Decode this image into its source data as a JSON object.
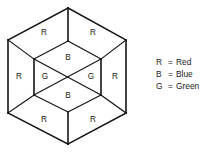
{
  "figure": {
    "shape_name": "hexagon-cube-diagram",
    "outer_vertices": [
      {
        "name": "top",
        "x": 68,
        "y": 8
      },
      {
        "name": "upper-right",
        "x": 126,
        "y": 40
      },
      {
        "name": "lower-right",
        "x": 126,
        "y": 113
      },
      {
        "name": "bottom",
        "x": 68,
        "y": 144
      },
      {
        "name": "lower-left",
        "x": 8,
        "y": 113
      },
      {
        "name": "upper-left",
        "x": 8,
        "y": 40
      }
    ],
    "inner_vertices": [
      {
        "name": "inner-top",
        "x": 68,
        "y": 41
      },
      {
        "name": "inner-upper-right",
        "x": 101,
        "y": 59
      },
      {
        "name": "inner-lower-right",
        "x": 101,
        "y": 95
      },
      {
        "name": "inner-bottom",
        "x": 68,
        "y": 112
      },
      {
        "name": "inner-lower-left",
        "x": 34,
        "y": 95
      },
      {
        "name": "inner-upper-left",
        "x": 34,
        "y": 59
      }
    ],
    "center": {
      "x": 68,
      "y": 77
    },
    "region_labels": [
      {
        "id": "top-left-region",
        "text": "R",
        "x": 44,
        "y": 33
      },
      {
        "id": "top-right-region",
        "text": "R",
        "x": 93,
        "y": 33
      },
      {
        "id": "upper-inner-region",
        "text": "B",
        "x": 68,
        "y": 58
      },
      {
        "id": "left-outer-region",
        "text": "R",
        "x": 19,
        "y": 77
      },
      {
        "id": "left-inner-region",
        "text": "G",
        "x": 45,
        "y": 77
      },
      {
        "id": "right-inner-region",
        "text": "G",
        "x": 91,
        "y": 77
      },
      {
        "id": "right-outer-region",
        "text": "R",
        "x": 115,
        "y": 77
      },
      {
        "id": "lower-inner-region",
        "text": "B",
        "x": 68,
        "y": 96
      },
      {
        "id": "bottom-left-region",
        "text": "R",
        "x": 44,
        "y": 120
      },
      {
        "id": "bottom-right-region",
        "text": "R",
        "x": 93,
        "y": 120
      }
    ],
    "line_color": "#141414",
    "background_color": "#ffffff"
  },
  "legend": {
    "equals_sign": "=",
    "entries": [
      {
        "key": "R",
        "value": "Red",
        "color": "#ff0000"
      },
      {
        "key": "B",
        "value": "Blue",
        "color": "#0000ff"
      },
      {
        "key": "G",
        "value": "Green",
        "color": "#008000"
      }
    ]
  }
}
